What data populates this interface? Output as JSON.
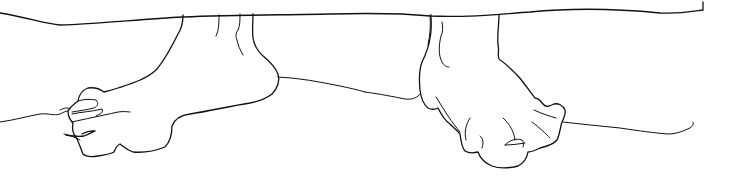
{
  "artwork": {
    "subject": "Contour line drawing of two bare feet hanging below a horizontal edge",
    "style": "single-weight black ink line on white",
    "colors": {
      "background": "#ffffff",
      "line": "#111111"
    }
  }
}
